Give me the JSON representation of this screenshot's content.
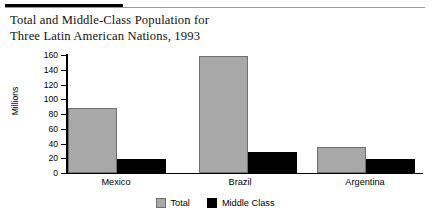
{
  "figure": {
    "title_lines": [
      "Total and Middle-Class Population for",
      "Three Latin American Nations, 1993"
    ],
    "rule_color": "#000000"
  },
  "chart_data": {
    "type": "bar",
    "title": "Total and Middle-Class Population for Three Latin American Nations, 1993",
    "categories": [
      "Mexico",
      "Brazil",
      "Argentina"
    ],
    "series": [
      {
        "name": "Total",
        "values": [
          88,
          159,
          35
        ],
        "color": "#a8a8a8"
      },
      {
        "name": "Middle Class",
        "values": [
          19,
          29,
          19
        ],
        "color": "#000000"
      }
    ],
    "xlabel": "",
    "ylabel": "Millions",
    "ylim": [
      0,
      160
    ],
    "yticks": [
      0,
      20,
      40,
      60,
      80,
      100,
      120,
      140,
      160
    ],
    "ytick_labels": [
      "0",
      "20",
      "40",
      "60",
      "80",
      "100",
      "120",
      "140",
      "160"
    ],
    "grid": false,
    "legend_position": "bottom-center",
    "legend_entries": [
      "Total",
      "Middle Class"
    ]
  }
}
